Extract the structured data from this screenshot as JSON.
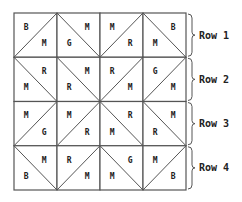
{
  "grid": {
    "rows": 4,
    "cols": 4,
    "cells": [
      [
        {
          "diag": "/",
          "a": "B",
          "b": "M"
        },
        {
          "diag": "\\",
          "a": "M",
          "b": "G"
        },
        {
          "diag": "/",
          "a": "M",
          "b": "R"
        },
        {
          "diag": "\\",
          "a": "B",
          "b": "M"
        }
      ],
      [
        {
          "diag": "\\",
          "a": "R",
          "b": "M"
        },
        {
          "diag": "\\",
          "a": "M",
          "b": "R"
        },
        {
          "diag": "/",
          "a": "R",
          "b": "M"
        },
        {
          "diag": "/",
          "a": "G",
          "b": "M"
        }
      ],
      [
        {
          "diag": "/",
          "a": "M",
          "b": "G"
        },
        {
          "diag": "/",
          "a": "M",
          "b": "R"
        },
        {
          "diag": "\\",
          "a": "R",
          "b": "M"
        },
        {
          "diag": "\\",
          "a": "M",
          "b": "R"
        }
      ],
      [
        {
          "diag": "\\",
          "a": "M",
          "b": "B"
        },
        {
          "diag": "/",
          "a": "R",
          "b": "M"
        },
        {
          "diag": "\\",
          "a": "G",
          "b": "M"
        },
        {
          "diag": "/",
          "a": "M",
          "b": "B"
        }
      ]
    ]
  },
  "row_labels": [
    "Row 1",
    "Row 2",
    "Row 3",
    "Row 4"
  ],
  "colors": {
    "line": "#555555",
    "text": "#222222"
  }
}
